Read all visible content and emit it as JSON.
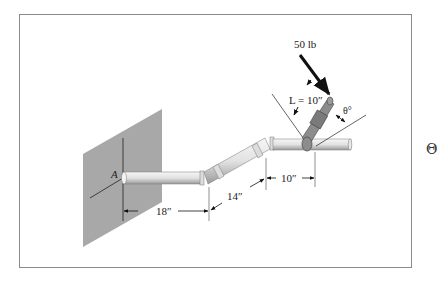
{
  "figure": {
    "force_label": "50 lb",
    "length_label": "L = 10″",
    "angle_label": "θ°",
    "point_label": "A",
    "dimensions": [
      {
        "label": "18″"
      },
      {
        "label": "14″"
      },
      {
        "label": "10″"
      }
    ],
    "colors": {
      "wall": "#a8a8a8",
      "pipe": "#e6e6e6",
      "pipe_shadow": "#9a9a9a",
      "wrench": "#8c8c8c",
      "frame_border": "#8a8a8a",
      "force_arrow": "#111111"
    }
  },
  "side_symbol": "Θ"
}
